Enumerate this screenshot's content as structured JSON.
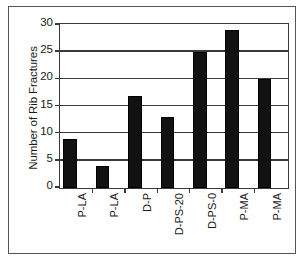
{
  "chart_data": {
    "type": "bar",
    "title": "",
    "subtitle": "",
    "xlabel": "",
    "ylabel": "Number of Rib Fractures",
    "categories": [
      "P-LA",
      "P-LA",
      "D-P",
      "D-PS-20",
      "D-PS-0",
      "P-MA",
      "P-MA"
    ],
    "values": [
      9,
      4,
      17,
      13,
      25,
      29,
      20
    ],
    "ylim": [
      0,
      30
    ],
    "yticks": [
      0,
      5,
      10,
      15,
      20,
      25,
      30
    ],
    "ytick_labels": [
      "0",
      "5",
      "10",
      "15",
      "20",
      "25",
      "30"
    ],
    "grid": true,
    "grid_axis": "y",
    "legend": false,
    "legend_position": "none",
    "bar_color": "#111111",
    "axis_color": "#3a3a3a",
    "frame_color": "#555555",
    "background_color": "#ffffff",
    "x_tick_labels_rotation": -90,
    "series": [
      {
        "name": "Rib Fractures",
        "values": [
          9,
          4,
          17,
          13,
          25,
          29,
          20
        ]
      }
    ]
  }
}
